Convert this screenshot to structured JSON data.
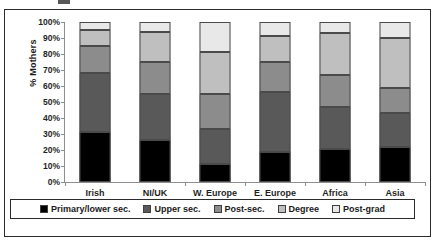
{
  "chart_data": {
    "type": "bar",
    "subtype": "stacked-100-percent",
    "title": "",
    "xlabel": "",
    "ylabel": "% Mothers",
    "ylim": [
      0,
      100
    ],
    "ytick_labels": [
      "100%",
      "90%",
      "80%",
      "70%",
      "60%",
      "50%",
      "40%",
      "30%",
      "20%",
      "10%",
      "0%"
    ],
    "ytick_values": [
      100,
      90,
      80,
      70,
      60,
      50,
      40,
      30,
      20,
      10,
      0
    ],
    "grid": false,
    "legend_position": "bottom",
    "categories": [
      "Irish",
      "NI/UK",
      "W. Europe",
      "E. Europe",
      "Africa",
      "Asia"
    ],
    "series": [
      {
        "name": "Primary/lower sec.",
        "color": "#000000",
        "values": [
          31.0,
          26.5,
          11.0,
          19.0,
          20.5,
          22.0
        ]
      },
      {
        "name": "Upper sec.",
        "color": "#595959",
        "values": [
          37.0,
          28.5,
          22.0,
          37.5,
          26.5,
          21.0
        ]
      },
      {
        "name": "Post-sec.",
        "color": "#8c8c8c",
        "values": [
          17.0,
          20.0,
          22.0,
          18.5,
          20.0,
          15.5
        ]
      },
      {
        "name": "Degree",
        "color": "#bfbfbf",
        "values": [
          10.0,
          19.0,
          26.0,
          16.0,
          26.0,
          31.5
        ]
      },
      {
        "name": "Post-grad",
        "color": "#e8e8e8",
        "values": [
          5.0,
          6.0,
          19.0,
          9.0,
          7.0,
          10.0
        ]
      }
    ],
    "cumulative_boundaries": [
      [
        31.0,
        68.0,
        85.0,
        95.0,
        100.0
      ],
      [
        26.5,
        55.0,
        75.0,
        94.0,
        100.0
      ],
      [
        11.0,
        33.0,
        55.0,
        81.0,
        100.0
      ],
      [
        19.0,
        56.5,
        75.0,
        91.0,
        100.0
      ],
      [
        20.5,
        47.0,
        67.0,
        93.0,
        100.0
      ],
      [
        22.0,
        43.0,
        58.5,
        90.0,
        100.0
      ]
    ]
  },
  "legend": {
    "items": [
      {
        "label": "Primary/lower sec.",
        "color": "#000000"
      },
      {
        "label": "Upper sec.",
        "color": "#595959"
      },
      {
        "label": "Post-sec.",
        "color": "#8c8c8c"
      },
      {
        "label": "Degree",
        "color": "#bfbfbf"
      },
      {
        "label": "Post-grad",
        "color": "#e8e8e8"
      }
    ]
  }
}
